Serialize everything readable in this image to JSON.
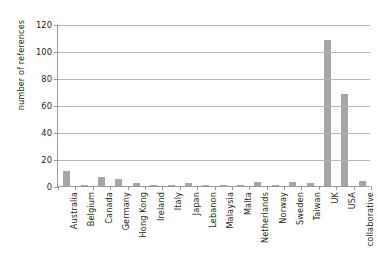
{
  "chart_data": {
    "type": "bar",
    "title": "",
    "xlabel": "",
    "ylabel": "number of references",
    "ylim": [
      0,
      120
    ],
    "yticks": [
      0,
      20,
      40,
      60,
      80,
      100,
      120
    ],
    "grid": true,
    "legend": "none",
    "bar_color": "#a6a6a6",
    "axis_color": "#9a9a9a",
    "grid_color": "#b7b7b7",
    "categories": [
      "Australia",
      "Belgium",
      "Canada",
      "Germany",
      "Hong Kong",
      "Ireland",
      "Italy",
      "Japan",
      "Lebanon",
      "Malaysia",
      "Malta",
      "Netherlands",
      "Norway",
      "Sweden",
      "Taiwan",
      "UK",
      "USA",
      "collaborative"
    ],
    "values": [
      11,
      1,
      7,
      5,
      2,
      1,
      1,
      2,
      1,
      1,
      1,
      3,
      1,
      3,
      2,
      108,
      68,
      4
    ]
  }
}
